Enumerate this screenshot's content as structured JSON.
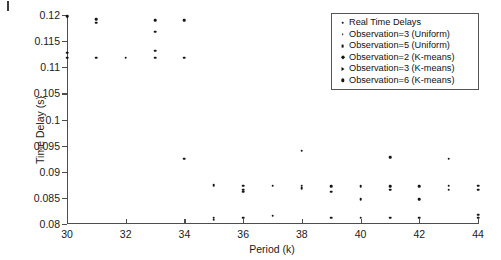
{
  "chart_data": {
    "type": "scatter",
    "title": "",
    "xlabel": "Period (k)",
    "ylabel": "Time Delay (s)",
    "xlim": [
      30,
      44
    ],
    "ylim": [
      0.08,
      0.12
    ],
    "xticks": [
      30,
      32,
      34,
      36,
      38,
      40,
      42,
      44
    ],
    "xticklabels": [
      "30",
      "32",
      "34",
      "36",
      "38",
      "40",
      "42",
      "44"
    ],
    "yticks": [
      0.08,
      0.085,
      0.09,
      0.095,
      0.1,
      0.105,
      0.11,
      0.115,
      0.12
    ],
    "yticklabels": [
      "0.08",
      "0.085",
      "0.09",
      "0.095",
      "0.1",
      "0.105",
      "0.11",
      "0.115",
      "0.12"
    ],
    "grid": false,
    "legend_position": "upper right",
    "series": [
      {
        "name": "Real Time Delays",
        "marker": "m-dot",
        "points": [
          [
            30,
            0.1198
          ],
          [
            30,
            0.1128
          ],
          [
            30,
            0.1118
          ],
          [
            31,
            0.1192
          ],
          [
            31,
            0.1185
          ],
          [
            31,
            0.1118
          ],
          [
            32,
            0.1118
          ],
          [
            33,
            0.119
          ],
          [
            33,
            0.1168
          ],
          [
            33,
            0.1132
          ],
          [
            33,
            0.1118
          ],
          [
            34,
            0.119
          ],
          [
            34,
            0.1118
          ],
          [
            34,
            0.0925
          ],
          [
            35,
            0.0874
          ],
          [
            35,
            0.0812
          ],
          [
            35,
            0.0808
          ],
          [
            36,
            0.0873
          ],
          [
            36,
            0.0866
          ],
          [
            36,
            0.0862
          ],
          [
            36,
            0.0812
          ],
          [
            37,
            0.0873
          ],
          [
            37,
            0.0816
          ],
          [
            38,
            0.094
          ],
          [
            38,
            0.0873
          ],
          [
            38,
            0.0868
          ],
          [
            39,
            0.0872
          ],
          [
            39,
            0.0862
          ],
          [
            39,
            0.0812
          ],
          [
            40,
            0.0872
          ],
          [
            40,
            0.0848
          ],
          [
            40,
            0.0812
          ],
          [
            41,
            0.0928
          ],
          [
            41,
            0.0872
          ],
          [
            41,
            0.0866
          ],
          [
            41,
            0.0812
          ],
          [
            42,
            0.0872
          ],
          [
            42,
            0.0847
          ],
          [
            42,
            0.0812
          ],
          [
            43,
            0.0925
          ],
          [
            43,
            0.0873
          ],
          [
            43,
            0.0866
          ],
          [
            44,
            0.0873
          ],
          [
            44,
            0.0866
          ],
          [
            44,
            0.0818
          ],
          [
            44,
            0.0812
          ]
        ]
      }
    ]
  },
  "legend": {
    "items": [
      {
        "label": "Real Time Delays",
        "marker": "m-dot"
      },
      {
        "label": "Observation=3 (Uniform)",
        "marker": "m-tiny"
      },
      {
        "label": "Observation=5 (Uniform)",
        "marker": "m-sq"
      },
      {
        "label": "Observation=2 (K-means)",
        "marker": "m-diamond"
      },
      {
        "label": "Observation=3 (K-means)",
        "marker": "m-tri"
      },
      {
        "label": "Observation=6 (K-means)",
        "marker": "m-big"
      }
    ]
  },
  "axes": {
    "x_title": "Period (k)",
    "y_title": "Time Delay (s)"
  }
}
